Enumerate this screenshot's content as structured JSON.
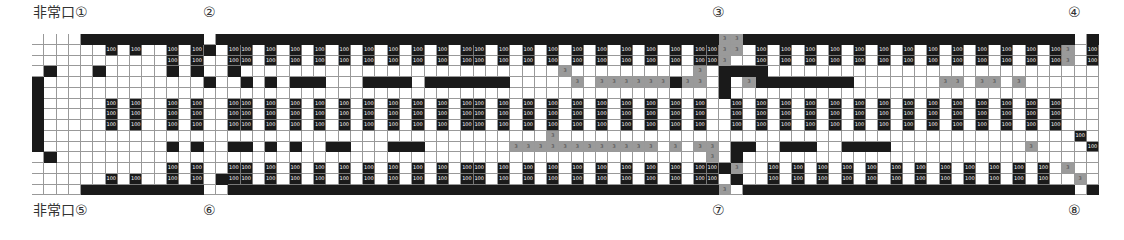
{
  "markers": [
    {
      "id": "exit-1",
      "text": "非常口①",
      "x": 33,
      "y": 4
    },
    {
      "id": "door-2",
      "text": "②",
      "x": 203,
      "y": 4
    },
    {
      "id": "door-3",
      "text": "③",
      "x": 712,
      "y": 4
    },
    {
      "id": "door-4",
      "text": "④",
      "x": 1068,
      "y": 4
    },
    {
      "id": "exit-5",
      "text": "非常口⑤",
      "x": 33,
      "y": 202
    },
    {
      "id": "door-6",
      "text": "⑥",
      "x": 203,
      "y": 202
    },
    {
      "id": "door-7",
      "text": "⑦",
      "x": 712,
      "y": 202
    },
    {
      "id": "door-8",
      "text": "⑧",
      "x": 1068,
      "y": 202
    }
  ],
  "legend": {
    "seat_value": "100",
    "gray_value": "3"
  },
  "colors": {
    "wall": "#1a1a1a",
    "seat": "#1a1a1a",
    "reserved": "#9a9a9a",
    "empty": "#ffffff"
  },
  "grid": {
    "columns": 87,
    "rows": [
      "....##########.#########################################gg###########################.#",
      "......1.1..1.1#.11.1.1.1.1.1.1.1.1.11.1.1.1.1.1.1.1.1.11gg.1.1.1.1.1.1.1.1.1.1.1.1.1g.1",
      "...........1.1..11.1.1.1.1.1.1.1.1.11.1.1.1.1.1.1.1.1.11g..1.1.1.1.1.1.1.1.1.1.1.1.1g.1",
      ".#...#.....#.#..#..........................g..........g.####...........................gg1",
      "#.............#..#.#.###...####.#######.....g.gggggg#gg.#.g########.......gg.gg.g.......1",
      "#.......................................................#...............................1",
      "#.....1.1..1.1..11.1.1.1.1.1.1.1.1.11.1.1.1.1.1.1.1.1.1..1.1.1.1.1.1.1.1.1.1.1.1.1.1....1",
      "#.....1.1..1.1..11.1.1.1.1.1.1.1.1.11.1.1.1.1.1.1.1.1.1..1.1.1.1.1.1.1.1.1.1.1.1.1.1....1",
      "#.....1.1..1.1..11.1.1.1.1.1.1.1.1.11.1.1.1.1.1.1.1.1.1..1.1.1.1.1.1.1.1.1.1.1.1.1.1....1",
      "#.........................................g..........................................1",
      "#..........#.#..##.#.#..##...###.......gggggggggggg.g.gg.##..###..####...........g....1",
      ".#.....................................................g.#.............................1",
      "...........1.1..11.1.1.1.1.1.1.1.1.11.1.1.1.1.1.1.1.1.11#g..1.1.1.1.1.1.1.1.1.1.1.1.g..1",
      "......1.1..1.1.#11.1.1.1.1.1.1.1.1.11.1.1.1.1.1.1.1.1.11.#..1.1.1.1.1.1.1.1.1.1.1.1..g.1",
      "....##########..########################################g.###########################.#"
    ]
  }
}
